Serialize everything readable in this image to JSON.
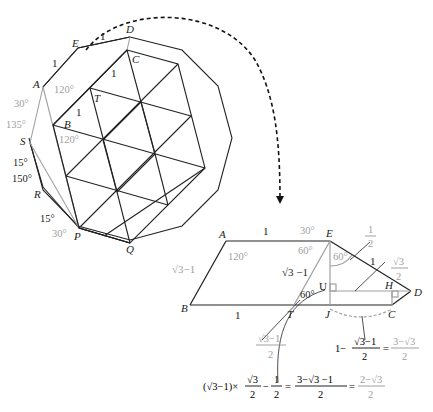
{
  "figure": {
    "top_left": {
      "vertices": {
        "A": "A",
        "B": "B",
        "C": "C",
        "D": "D",
        "E": "E",
        "P": "P",
        "Q": "Q",
        "R": "R",
        "S": "S",
        "T": "T"
      },
      "edge_labels": {
        "AE": "1",
        "ED": "1",
        "TC": "1",
        "BT": "1"
      },
      "angles": {
        "A_outer": "120°",
        "B_outer": "120°",
        "A_left": "30°",
        "S_top": "135°",
        "S_bottom": "15°",
        "R_top": "150°",
        "P_upper": "15°",
        "P_lower": "30°"
      }
    },
    "bottom_right": {
      "vertices": {
        "A": "A",
        "B": "B",
        "T": "T",
        "J": "J",
        "C": "C",
        "D": "D",
        "E": "E",
        "H": "H",
        "U": "U"
      },
      "edge_labels": {
        "AE": "1",
        "BT": "1",
        "AB": "√3−1",
        "TE": "√3 −1",
        "ED": "1"
      },
      "angles": {
        "A": "120°",
        "E_top": "30°",
        "E_left": "60°",
        "E_right": "60°",
        "T": "60°"
      },
      "fractions": {
        "half": {
          "num": "1",
          "den": "2"
        },
        "root3_over_2": {
          "num": "√3",
          "den": "2"
        },
        "TJ": {
          "num": "√3−1",
          "den": "2"
        }
      },
      "equations": {
        "JC": {
          "lhs_prefix": "1−",
          "lhs_num": "√3−1",
          "lhs_den": "2",
          "eq": "=",
          "rhs_num": "3−√3",
          "rhs_den": "2"
        },
        "UJ": {
          "lhs": "(√3−1)×",
          "f1_num": "√3",
          "f1_den": "2",
          "minus": "−",
          "f2_num": "1",
          "f2_den": "2",
          "eq1": "=",
          "mid_num": "3−√3 −1",
          "mid_den": "2",
          "eq2": "=",
          "rhs_num": "2−√3",
          "rhs_den": "2"
        }
      }
    },
    "colors": {
      "line": "#222222",
      "aux": "#a0a0a0",
      "arrow": "#111111"
    }
  }
}
